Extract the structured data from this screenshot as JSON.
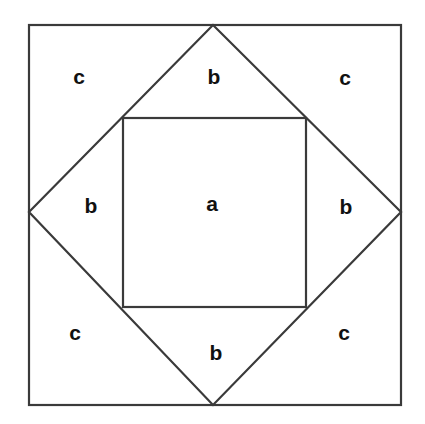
{
  "diagram": {
    "colors": {
      "background": "#ffffff",
      "stroke": "#3a3a3a",
      "text": "#111111"
    },
    "shapes": {
      "outer_square": {
        "x1": 29,
        "y1": 25,
        "x2": 401,
        "y2": 405
      },
      "diamond": {
        "top": [
          213,
          25
        ],
        "right": [
          401,
          212
        ],
        "bottom": [
          213,
          405
        ],
        "left": [
          29,
          212
        ]
      },
      "inner_square": {
        "x1": 123,
        "y1": 118,
        "x2": 306,
        "y2": 307
      }
    },
    "labels": [
      {
        "id": "c-top-left",
        "text": "c",
        "x": 79,
        "y": 76
      },
      {
        "id": "b-top",
        "text": "b",
        "x": 214,
        "y": 76
      },
      {
        "id": "c-top-right",
        "text": "c",
        "x": 345,
        "y": 77
      },
      {
        "id": "b-left",
        "text": "b",
        "x": 91,
        "y": 205
      },
      {
        "id": "a-center",
        "text": "a",
        "x": 212,
        "y": 203
      },
      {
        "id": "b-right",
        "text": "b",
        "x": 346,
        "y": 206
      },
      {
        "id": "c-bottom-left",
        "text": "c",
        "x": 75,
        "y": 332
      },
      {
        "id": "b-bottom",
        "text": "b",
        "x": 216,
        "y": 352
      },
      {
        "id": "c-bottom-right",
        "text": "c",
        "x": 344,
        "y": 332
      }
    ]
  }
}
